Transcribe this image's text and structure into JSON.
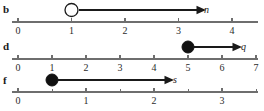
{
  "figure": {
    "type": "number-line-inequality-graphs",
    "width": 264,
    "height": 111,
    "background": "#ffffff",
    "line_color": "#6e6e6e",
    "ink_color": "#1a1a1a"
  },
  "rows": [
    {
      "label": "b",
      "label_x": 3,
      "label_y": 4,
      "axis_y": 22,
      "axis_x_start": 12,
      "axis_x_end": 258,
      "origin_x": 18,
      "unit_px": 53.5,
      "tick_labels": [
        "0",
        "1",
        "2",
        "3",
        "4"
      ],
      "tick_values": [
        0,
        1,
        2,
        3,
        4
      ],
      "minor_tick_values": [],
      "tick_label_y": 26,
      "endpoint": {
        "value": 1,
        "style": "open",
        "radius": 6.5,
        "fill": "#ffffff",
        "stroke": "#1a1a1a"
      },
      "ray": {
        "direction": "right",
        "y": 10,
        "x_start": 78.5,
        "x_end": 200,
        "arrow": true
      },
      "ray_label": {
        "text": "n",
        "x": 204,
        "y": 5
      }
    },
    {
      "label": "d",
      "label_x": 3,
      "label_y": 41,
      "axis_y": 59,
      "axis_x_start": 12,
      "axis_x_end": 258,
      "origin_x": 18,
      "unit_px": 34.0,
      "tick_labels": [
        "0",
        "1",
        "2",
        "3",
        "4",
        "5",
        "6",
        "7"
      ],
      "tick_values": [
        0,
        1,
        2,
        3,
        4,
        5,
        6,
        7
      ],
      "minor_tick_values": [],
      "tick_label_y": 63,
      "endpoint": {
        "value": 5,
        "style": "closed",
        "radius": 6.0,
        "fill": "#111111",
        "stroke": "#111111"
      },
      "ray": {
        "direction": "right",
        "y": 47,
        "x_start": 194,
        "x_end": 236,
        "arrow": true
      },
      "ray_label": {
        "text": "q",
        "x": 241,
        "y": 42
      }
    },
    {
      "label": "f",
      "label_x": 3,
      "label_y": 75,
      "axis_y": 92,
      "axis_x_start": 12,
      "axis_x_end": 258,
      "origin_x": 18,
      "unit_px": 68.0,
      "tick_labels": [
        "0",
        "1",
        "2",
        "3"
      ],
      "tick_values": [
        0,
        1,
        2,
        3
      ],
      "minor_tick_values": [
        0.5,
        1.5,
        2.5,
        3.5
      ],
      "tick_label_y": 96,
      "endpoint": {
        "value": 0.5,
        "style": "closed",
        "radius": 6.0,
        "fill": "#111111",
        "stroke": "#111111"
      },
      "ray": {
        "direction": "right",
        "y": 80,
        "x_start": 58,
        "x_end": 168,
        "arrow": true
      },
      "ray_label": {
        "text": "s",
        "x": 173,
        "y": 75
      }
    }
  ]
}
